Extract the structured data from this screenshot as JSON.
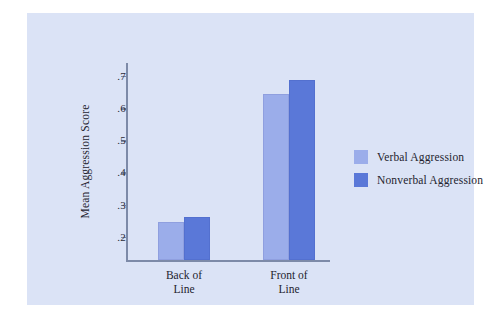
{
  "chart_data": {
    "type": "bar",
    "title": "",
    "xlabel": "",
    "ylabel": "Mean Aggression Score",
    "categories": [
      "Back of\nLine",
      "Front of\nLine"
    ],
    "category_lines": [
      [
        "Back of",
        "Line"
      ],
      [
        "Front of",
        "Line"
      ]
    ],
    "series": [
      {
        "name": "Verbal Aggression",
        "values": [
          0.245,
          0.645
        ],
        "color": "#9badea"
      },
      {
        "name": "Nonverbal Aggression",
        "values": [
          0.263,
          0.688
        ],
        "color": "#5a78d8"
      }
    ],
    "yticks": [
      ".2",
      ".3",
      ".4",
      ".5",
      ".6",
      ".7"
    ],
    "ytick_values": [
      0.2,
      0.3,
      0.4,
      0.5,
      0.6,
      0.7
    ],
    "ylim": [
      0.128,
      0.74
    ],
    "grid": false,
    "legend_position": "right"
  },
  "legend": {
    "items": [
      {
        "label": "Verbal Aggression",
        "swatch": "light"
      },
      {
        "label": "Nonverbal Aggression",
        "swatch": "dark"
      }
    ]
  },
  "colors": {
    "panel_background": "#dbe3f6",
    "page_background": "#ffffff",
    "axis": "#7d8aa8",
    "text": "#24242f",
    "series_light": "#9badea",
    "series_dark": "#5a78d8"
  }
}
